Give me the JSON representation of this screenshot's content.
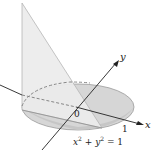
{
  "figure": {
    "axis_labels": {
      "x": "x",
      "y": "y"
    },
    "origin_label": "0",
    "tick_label_x": "1",
    "equation": {
      "base": "x",
      "sup1": "2",
      "plus": " + ",
      "base2": "y",
      "sup2": "2",
      "rhs": " = 1"
    },
    "colors": {
      "disk_fill": "#d4d4d4",
      "disk_front_fill": "#c4c4c4",
      "wedge_fill": "#e6e6e6",
      "wedge_edge": "#b8b8b8",
      "axis": "#222222",
      "dashed": "#777777"
    }
  }
}
